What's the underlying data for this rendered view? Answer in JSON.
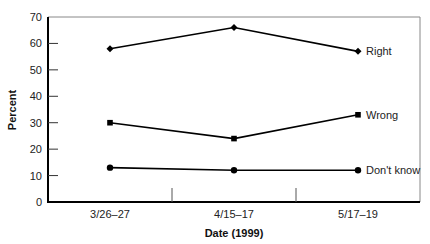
{
  "chart_data": {
    "type": "line",
    "title": "",
    "xlabel": "Date (1999)",
    "ylabel": "Percent",
    "categories": [
      "3/26–27",
      "4/15–17",
      "5/17–19"
    ],
    "ylim": [
      0,
      70
    ],
    "yticks": [
      0,
      10,
      20,
      30,
      40,
      50,
      60,
      70
    ],
    "grid": false,
    "legend": "inline labels at right end of each series",
    "series": [
      {
        "name": "Right",
        "marker": "diamond",
        "values": [
          58,
          66,
          57
        ]
      },
      {
        "name": "Wrong",
        "marker": "square",
        "values": [
          30,
          24,
          33
        ]
      },
      {
        "name": "Don't know",
        "marker": "circle",
        "values": [
          13,
          12,
          12
        ]
      }
    ]
  }
}
